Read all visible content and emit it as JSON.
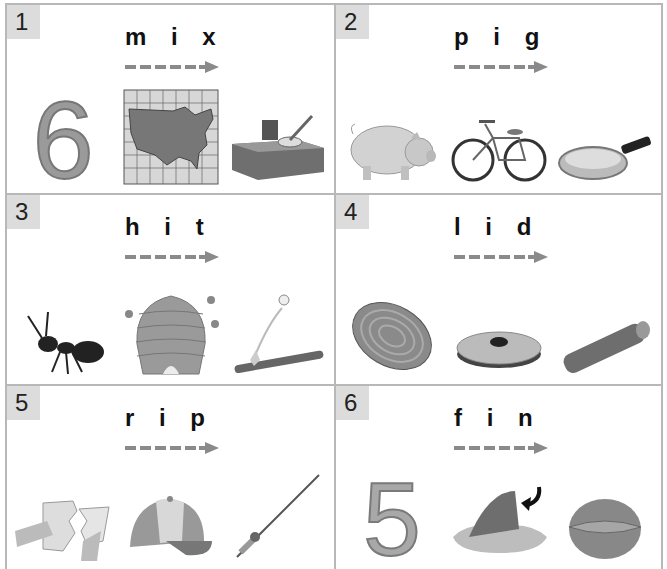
{
  "worksheet": {
    "items": [
      {
        "number": "1",
        "word": "m i x",
        "pictures": [
          "number-six",
          "map",
          "mixing-bowl"
        ]
      },
      {
        "number": "2",
        "word": "p i g",
        "pictures": [
          "pig",
          "bicycle",
          "frying-pan"
        ]
      },
      {
        "number": "3",
        "word": "h i t",
        "pictures": [
          "ant",
          "beehive",
          "bat-hitting-ball"
        ]
      },
      {
        "number": "4",
        "word": "l i d",
        "pictures": [
          "tree-ring",
          "lid",
          "log"
        ]
      },
      {
        "number": "5",
        "word": "r i p",
        "pictures": [
          "ripping-paper",
          "cap",
          "fishing-rod"
        ]
      },
      {
        "number": "6",
        "word": "f i n",
        "pictures": [
          "number-five",
          "fin",
          "nut"
        ]
      }
    ],
    "digits": {
      "six": "6",
      "five": "5"
    },
    "colors": {
      "border": "#b8b8b8",
      "badge": "#dcdcdc",
      "arrow": "#8a8a8a",
      "text": "#111111"
    }
  }
}
